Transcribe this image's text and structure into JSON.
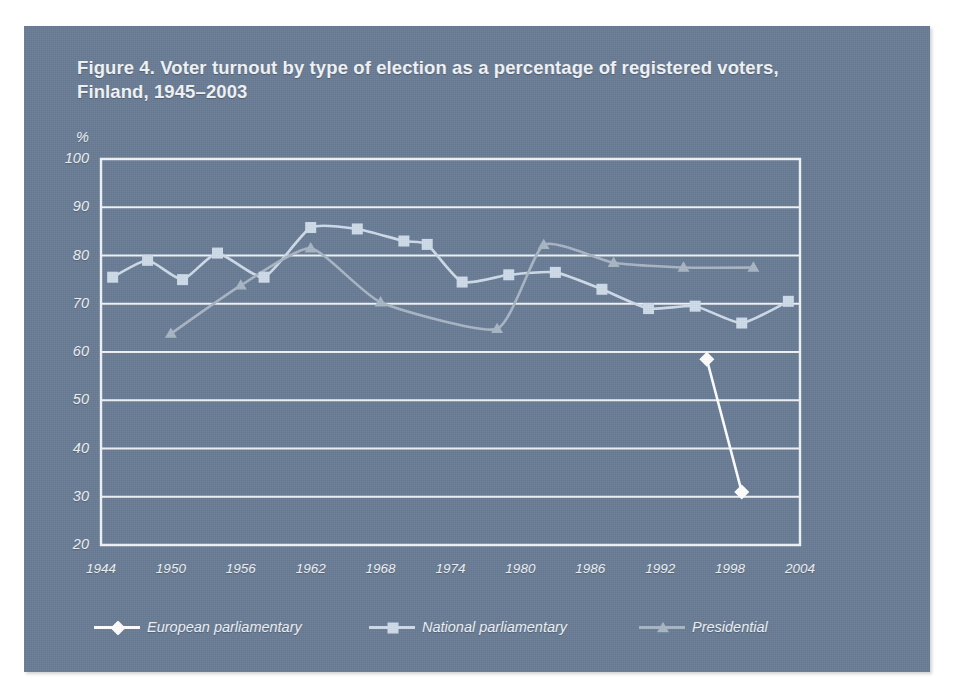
{
  "figure": {
    "title_line1": "Figure 4. Voter turnout by type of election as a percentage of registered voters,",
    "title_line2": "Finland, 1945–2003"
  },
  "colors": {
    "panel_background": "#6a7d96",
    "page_background": "#ffffff",
    "gridline": "#f1f4f7",
    "axis_frame": "#f1f4f7",
    "text": "#eef2f6",
    "european_parliamentary": "#ffffff",
    "national_parliamentary": "#cfdcea",
    "presidential": "#a9b6c4"
  },
  "axes": {
    "y_unit_label": "%",
    "y_ticks": [
      "100",
      "90",
      "80",
      "70",
      "60",
      "50",
      "40",
      "30",
      "20"
    ],
    "x_ticks": [
      "1944",
      "1950",
      "1956",
      "1962",
      "1968",
      "1974",
      "1980",
      "1986",
      "1992",
      "1998",
      "2004"
    ]
  },
  "legend": {
    "items": [
      {
        "label": "European parliamentary",
        "marker": "diamond-marker-icon",
        "color": "#ffffff"
      },
      {
        "label": "National parliamentary",
        "marker": "square-marker-icon",
        "color": "#cfdcea"
      },
      {
        "label": "Presidential",
        "marker": "triangle-marker-icon",
        "color": "#a9b6c4"
      }
    ]
  },
  "chart_data": {
    "type": "line",
    "title": "Figure 4. Voter turnout by type of election as a percentage of registered voters, Finland, 1945–2003",
    "xlabel": "",
    "ylabel": "%",
    "xlim": [
      1944,
      2004
    ],
    "ylim": [
      20,
      100
    ],
    "ytick_step": 10,
    "xtick_step": 6,
    "grid": "horizontal",
    "legend_position": "bottom",
    "series": [
      {
        "name": "European parliamentary",
        "marker": "diamond",
        "color": "#ffffff",
        "points": [
          {
            "x": 1996,
            "y": 58.5
          },
          {
            "x": 1999,
            "y": 31.0
          }
        ]
      },
      {
        "name": "National parliamentary",
        "marker": "square",
        "color": "#cfdcea",
        "points": [
          {
            "x": 1945,
            "y": 75.5
          },
          {
            "x": 1948,
            "y": 79.0
          },
          {
            "x": 1951,
            "y": 75.0
          },
          {
            "x": 1954,
            "y": 80.5
          },
          {
            "x": 1958,
            "y": 75.5
          },
          {
            "x": 1962,
            "y": 85.8
          },
          {
            "x": 1966,
            "y": 85.5
          },
          {
            "x": 1970,
            "y": 83.0
          },
          {
            "x": 1972,
            "y": 82.3
          },
          {
            "x": 1975,
            "y": 74.5
          },
          {
            "x": 1979,
            "y": 76.0
          },
          {
            "x": 1983,
            "y": 76.5
          },
          {
            "x": 1987,
            "y": 73.0
          },
          {
            "x": 1991,
            "y": 69.0
          },
          {
            "x": 1995,
            "y": 69.5
          },
          {
            "x": 1999,
            "y": 66.0
          },
          {
            "x": 2003,
            "y": 70.5
          }
        ]
      },
      {
        "name": "Presidential",
        "marker": "triangle",
        "color": "#a9b6c4",
        "points": [
          {
            "x": 1950,
            "y": 63.8
          },
          {
            "x": 1956,
            "y": 73.8
          },
          {
            "x": 1962,
            "y": 81.5
          },
          {
            "x": 1968,
            "y": 70.3
          },
          {
            "x": 1978,
            "y": 64.8
          },
          {
            "x": 1982,
            "y": 82.2
          },
          {
            "x": 1988,
            "y": 78.5
          },
          {
            "x": 1994,
            "y": 77.5
          },
          {
            "x": 2000,
            "y": 77.5
          }
        ]
      }
    ]
  },
  "plot_geometry": {
    "left": 101,
    "right": 800,
    "top": 159,
    "bottom": 545
  }
}
